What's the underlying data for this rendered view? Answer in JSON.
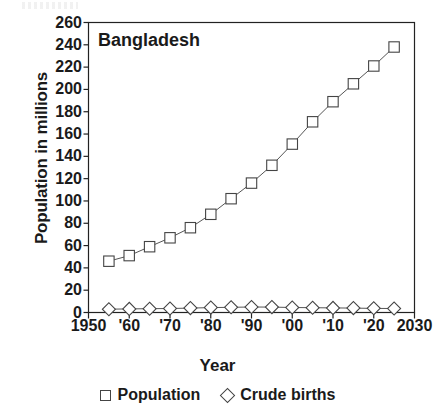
{
  "chart_data": {
    "type": "line",
    "title": "Bangladesh",
    "xlabel": "Year",
    "ylabel": "Population in millions",
    "xlim": [
      1950,
      2030
    ],
    "ylim": [
      0,
      260
    ],
    "ytick_step": 20,
    "grid": false,
    "legend_position": "bottom",
    "x_tick_labels": [
      "1950",
      "'60",
      "'70",
      "'80",
      "'90",
      "'00",
      "'10",
      "'20",
      "2030"
    ],
    "x_tick_values": [
      1950,
      1960,
      1970,
      1980,
      1990,
      2000,
      2010,
      2020,
      2030
    ],
    "y_tick_labels": [
      "260",
      "240",
      "220",
      "200",
      "180",
      "160",
      "140",
      "120",
      "100",
      "80",
      "60",
      "40",
      "20",
      "0"
    ],
    "y_tick_values": [
      260,
      240,
      220,
      200,
      180,
      160,
      140,
      120,
      100,
      80,
      60,
      40,
      20,
      0
    ],
    "x": [
      1955,
      1960,
      1965,
      1970,
      1975,
      1980,
      1985,
      1990,
      1995,
      2000,
      2005,
      2010,
      2015,
      2020,
      2025
    ],
    "series": [
      {
        "name": "Population",
        "marker": "square",
        "values": [
          46,
          51,
          59,
          67,
          76,
          88,
          102,
          116,
          132,
          151,
          171,
          189,
          205,
          221,
          238
        ]
      },
      {
        "name": "Crude births",
        "marker": "diamond",
        "values": [
          3.0,
          3.2,
          3.4,
          3.6,
          3.9,
          4.4,
          4.7,
          4.9,
          4.8,
          4.5,
          4.3,
          4.1,
          3.9,
          3.7,
          3.6
        ]
      }
    ]
  },
  "legend": {
    "items": [
      {
        "label": "Population",
        "marker": "square"
      },
      {
        "label": "Crude births",
        "marker": "diamond"
      }
    ]
  },
  "colors": {
    "line": "#555555",
    "marker_stroke": "#444444",
    "axis": "#222222",
    "text": "#1a1a1a",
    "background": "#ffffff"
  }
}
